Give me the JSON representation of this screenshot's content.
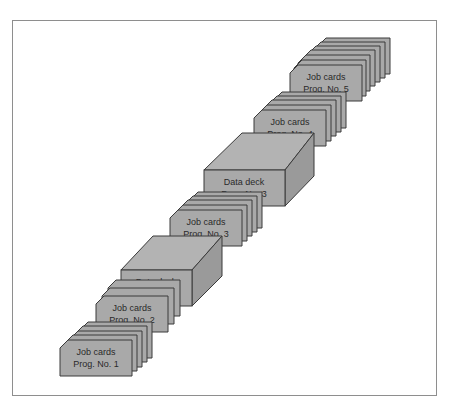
{
  "diagram": {
    "type": "card-deck-stack-sequence",
    "colors": {
      "face": "#a9a9a9",
      "side": "#9a9a9a",
      "top": "#b3b3b3",
      "outline": "#3a3a3a",
      "frame": "#8e8e8e"
    },
    "items": [
      {
        "kind": "job-cards",
        "line1": "Job cards",
        "line2": "Prog. No. 1"
      },
      {
        "kind": "job-cards",
        "line1": "Job cards",
        "line2": "Prog. No. 2"
      },
      {
        "kind": "data-deck",
        "line1": "Data deck",
        "line2": "Prog. No. 2"
      },
      {
        "kind": "job-cards",
        "line1": "Job cards",
        "line2": "Prog. No. 3"
      },
      {
        "kind": "data-deck",
        "line1": "Data deck",
        "line2": "Prog. No. 3"
      },
      {
        "kind": "job-cards",
        "line1": "Job cards",
        "line2": "Prog. No. 4"
      },
      {
        "kind": "job-cards",
        "line1": "Job cards",
        "line2": "Prog. No. 5"
      }
    ]
  }
}
